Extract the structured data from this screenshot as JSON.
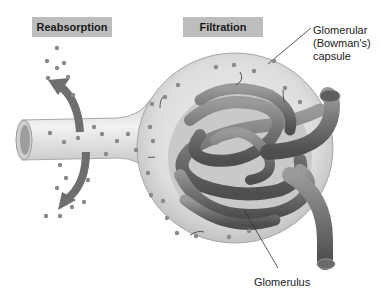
{
  "diagram": {
    "style": "grayscale illustration",
    "header_labels": {
      "reabsorption": "Reabsorption",
      "filtration": "Filtration"
    },
    "callouts": {
      "capsule_line1": "Glomerular",
      "capsule_line2": "(Bowman's)",
      "capsule_line3": "capsule",
      "glomerulus": "Glomerulus"
    },
    "colors": {
      "label_box": "#bdbdbd",
      "capsule": "#e2e2e2",
      "capillary": "#7a7a7a",
      "arrow": "#6e6e6e",
      "particle": "#8a8a8a"
    }
  }
}
